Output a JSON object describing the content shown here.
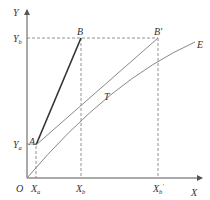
{
  "diagram": {
    "axes": {
      "y_label": "Y",
      "x_label": "X",
      "origin_label": "O"
    },
    "points": {
      "A": "A",
      "B": "B",
      "B_prime": "B'",
      "T": "T",
      "E": "E"
    },
    "y_ticks": [
      {
        "main": "Y",
        "sub": "b"
      },
      {
        "main": "Y",
        "sub": "a"
      }
    ],
    "x_ticks": [
      {
        "main": "X",
        "sub": "a"
      },
      {
        "main": "X",
        "sub": "b"
      },
      {
        "main": "X",
        "sub": "b",
        "prime": "'"
      }
    ],
    "colors": {
      "axis": "#555555",
      "line_AB": "#333333",
      "line_gray": "#888888",
      "dashed": "#777777"
    }
  }
}
